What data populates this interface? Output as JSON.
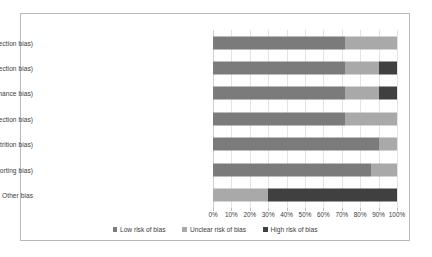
{
  "chart_data": {
    "type": "bar",
    "orientation": "horizontal",
    "stacked": true,
    "stacked_mode": "percent",
    "title": "",
    "xlabel": "",
    "ylabel": "",
    "xlim": [
      0,
      100
    ],
    "grid": true,
    "legend_position": "bottom",
    "xticks": [
      0,
      10,
      20,
      30,
      40,
      50,
      60,
      70,
      80,
      90,
      100
    ],
    "xtick_labels": [
      "0%",
      "10%",
      "20%",
      "30%",
      "40%",
      "50%",
      "60%",
      "70%",
      "80%",
      "90%",
      "100%"
    ],
    "categories": [
      "Random sequence generation (selection bias)",
      "Allocation concealment (selection bias)",
      "Blinding of participants and personnel (performance bias)",
      "Blinding of outcome assessment (detection bias)",
      "Incomplete outcome data (attrition bias)",
      "Selective reporting (reporting bias)",
      "Other bias"
    ],
    "series": [
      {
        "name": "Low risk of bias",
        "color": "#7b7b7b",
        "values": [
          72,
          72,
          72,
          72,
          90,
          86,
          0
        ]
      },
      {
        "name": "Unclear risk of bias",
        "color": "#a9a9a9",
        "values": [
          28,
          18,
          18,
          28,
          10,
          14,
          30
        ]
      },
      {
        "name": "High risk of bias",
        "color": "#404040",
        "values": [
          0,
          10,
          10,
          0,
          0,
          0,
          70
        ]
      }
    ]
  },
  "legend": {
    "items": [
      {
        "label": "Low risk of bias",
        "key": "low"
      },
      {
        "label": "Unclear risk of bias",
        "key": "unclear"
      },
      {
        "label": "High risk of bias",
        "key": "high"
      }
    ]
  }
}
